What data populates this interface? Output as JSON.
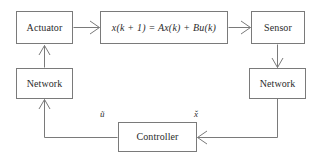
{
  "diagram": {
    "line_color": "#7a7a7a",
    "text_color": "#2b2b2b",
    "background_color": "#ffffff",
    "nodes": [
      {
        "id": "actuator",
        "label": "Actuator"
      },
      {
        "id": "plant",
        "label": "x(k + 1) = Ax(k) + Bu(k)"
      },
      {
        "id": "sensor",
        "label": "Sensor"
      },
      {
        "id": "network-rx",
        "label": "Network"
      },
      {
        "id": "network-tx",
        "label": "Network"
      },
      {
        "id": "controller",
        "label": "Controller"
      }
    ],
    "edge_labels": [
      {
        "id": "u-tilde",
        "label": "ũ"
      },
      {
        "id": "x-check",
        "label": "x̌"
      }
    ],
    "edges": [
      {
        "from": "actuator",
        "to": "plant",
        "arrow": "open-v",
        "direction": "right"
      },
      {
        "from": "plant",
        "to": "sensor",
        "arrow": "open-v",
        "direction": "right"
      },
      {
        "from": "sensor",
        "to": "network-tx",
        "arrow": "open-v",
        "direction": "down"
      },
      {
        "from": "network-tx",
        "to": "controller",
        "arrow": "open-v",
        "direction": "left"
      },
      {
        "from": "controller",
        "to": "network-rx",
        "arrow": "open-v",
        "direction": "up"
      },
      {
        "from": "network-rx",
        "to": "actuator",
        "arrow": "open-v",
        "direction": "up"
      }
    ]
  }
}
